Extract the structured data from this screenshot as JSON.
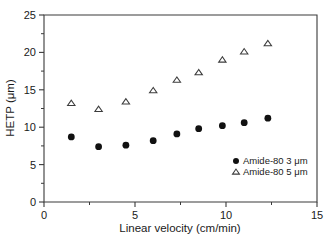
{
  "chart_data": {
    "type": "scatter",
    "title": "",
    "xlabel": "Linear velocity (cm/min)",
    "ylabel": "HETP (μm)",
    "xlim": [
      0,
      15
    ],
    "ylim": [
      0,
      25
    ],
    "xticks": [
      0,
      5,
      10,
      15
    ],
    "yticks": [
      0,
      5,
      10,
      15,
      20,
      25
    ],
    "xtick_labels": [
      "0",
      "5",
      "10",
      "15"
    ],
    "ytick_labels": [
      "0",
      "5",
      "10",
      "15",
      "20",
      "25"
    ],
    "x_minor_ticks": [
      2.5,
      7.5,
      12.5
    ],
    "y_minor_ticks": [
      2.5,
      7.5,
      12.5,
      17.5,
      22.5
    ],
    "grid": false,
    "legend_position": "lower right",
    "series": [
      {
        "name": "Amide-80 3 μm",
        "marker": "filled-circle",
        "color": "#111111",
        "x": [
          1.5,
          3.0,
          4.5,
          6.0,
          7.3,
          8.5,
          9.8,
          11.0,
          12.3
        ],
        "y": [
          8.7,
          7.4,
          7.6,
          8.2,
          9.1,
          9.8,
          10.2,
          10.6,
          11.2
        ]
      },
      {
        "name": "Amide-80 5 μm",
        "marker": "open-triangle",
        "color": "#3c3c3c",
        "x": [
          1.5,
          3.0,
          4.5,
          6.0,
          7.3,
          8.5,
          9.8,
          11.0,
          12.3
        ],
        "y": [
          13.2,
          12.4,
          13.4,
          14.9,
          16.3,
          17.3,
          19.0,
          20.1,
          21.2
        ]
      }
    ]
  },
  "legend": {
    "entries": [
      {
        "label": "Amide-80 3 μm",
        "marker": "filled-circle"
      },
      {
        "label": "Amide-80 5 μm",
        "marker": "open-triangle"
      }
    ]
  },
  "axes": {
    "x_title": "Linear velocity (cm/min)",
    "y_title": "HETP (μm)"
  }
}
